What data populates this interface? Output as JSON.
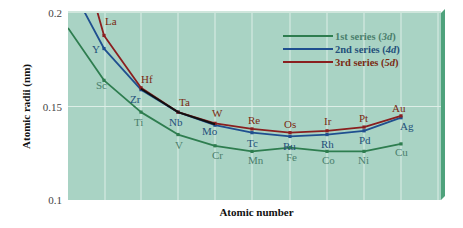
{
  "chart_data": {
    "type": "line",
    "title": "",
    "xlabel": "Atomic number",
    "ylabel": "Atomic radii (nm)",
    "ylim": [
      0.1,
      0.2
    ],
    "yticks": [
      "0.2",
      "0.15",
      "0.1"
    ],
    "grid": true,
    "legend_position": "upper right",
    "colors": {
      "background": "#a9d3c4",
      "grid": "#ddeee7",
      "edge": "#4fa27c",
      "series1": "#2e7d4f",
      "series2": "#1f4f8f",
      "series3": "#8a1f1f",
      "overlap": "#111111",
      "label1": "#3f7a63",
      "label2": "#21476e"
    },
    "series": [
      {
        "name": "1st series (3d)",
        "prefix": "1st series (",
        "italic": "3d",
        "suffix": ")",
        "color": "#2e7d4f",
        "label_color": "#4b7f6c",
        "elements": [
          "Sc",
          "Ti",
          "V",
          "Cr",
          "Mn",
          "Fe",
          "Co",
          "Ni",
          "Cu"
        ],
        "values": [
          0.164,
          0.147,
          0.135,
          0.129,
          0.126,
          0.128,
          0.126,
          0.126,
          0.13
        ]
      },
      {
        "name": "2nd series (4d)",
        "prefix": "2nd series (",
        "italic": "4d",
        "suffix": ")",
        "color": "#1f4f8f",
        "label_color": "#24507a",
        "elements": [
          "Y",
          "Zr",
          "Nb",
          "Mo",
          "Tc",
          "Ru",
          "Rh",
          "Pd",
          "Ag"
        ],
        "values": [
          0.181,
          0.159,
          0.147,
          0.14,
          0.136,
          0.134,
          0.135,
          0.137,
          0.144
        ]
      },
      {
        "name": "3rd series (5d)",
        "prefix": "3rd series (",
        "italic": "5d",
        "suffix": ")",
        "color": "#8a1f1f",
        "label_color": "#7a2a12",
        "elements": [
          "La",
          "Hf",
          "Ta",
          "W",
          "Re",
          "Os",
          "Ir",
          "Pt",
          "Au"
        ],
        "values": [
          0.188,
          0.16,
          0.147,
          0.141,
          0.138,
          0.136,
          0.137,
          0.139,
          0.145
        ]
      }
    ]
  }
}
